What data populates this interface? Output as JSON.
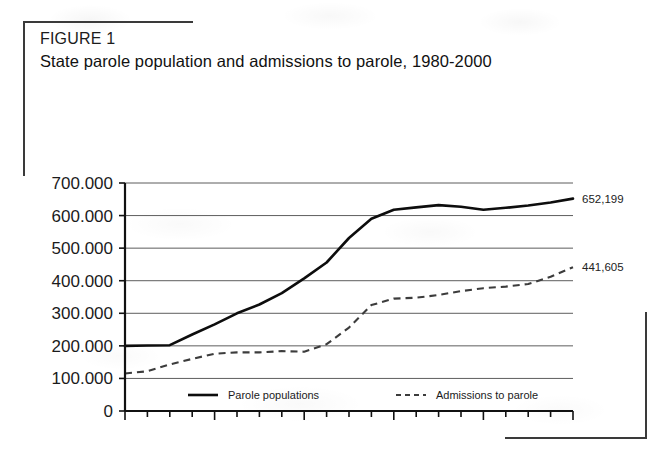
{
  "figure": {
    "label": "FIGURE 1",
    "title": "State parole population and admissions to parole, 1980-2000"
  },
  "chart_data": {
    "type": "line",
    "title": "State parole population and admissions to parole, 1980-2000",
    "xlabel": "",
    "ylabel": "",
    "xlim": [
      1980,
      2000
    ],
    "ylim": [
      0,
      700000
    ],
    "grid": true,
    "legend_position": "bottom",
    "x": [
      1980,
      1981,
      1982,
      1983,
      1984,
      1985,
      1986,
      1987,
      1988,
      1989,
      1990,
      1991,
      1992,
      1993,
      1994,
      1995,
      1996,
      1997,
      1998,
      1999,
      2000
    ],
    "y_ticks": [
      0,
      100000,
      200000,
      300000,
      400000,
      500000,
      600000,
      700000
    ],
    "y_tick_labels": [
      "0",
      "100.000",
      "200.000",
      "300.000",
      "400.000",
      "500.000",
      "600.000",
      "700.000"
    ],
    "x_ticks": [
      1980,
      1984,
      1988,
      1992,
      1996,
      2000
    ],
    "x_tick_labels": [
      "1980",
      "1984",
      "1988",
      "1992",
      "1996",
      "2000"
    ],
    "series": [
      {
        "name": "Parole populations",
        "style": "solid",
        "color": "#0d0d0d",
        "end_label": "652,199",
        "values": [
          200000,
          201000,
          202000,
          235000,
          266000,
          300000,
          327000,
          362000,
          407000,
          456000,
          531000,
          590000,
          618000,
          625000,
          632000,
          627000,
          618000,
          624000,
          631000,
          640000,
          652199
        ]
      },
      {
        "name": "Admissions to parole",
        "style": "dashed",
        "color": "#3c3c3c",
        "end_label": "441,605",
        "values": [
          115000,
          122000,
          143000,
          160000,
          176000,
          180000,
          180000,
          184000,
          182000,
          205000,
          256000,
          325000,
          345000,
          348000,
          356000,
          368000,
          377000,
          382000,
          390000,
          412000,
          441605
        ]
      }
    ]
  },
  "legend": {
    "items": [
      {
        "label": "Parole populations",
        "style": "solid"
      },
      {
        "label": "Admissions to parole",
        "style": "dashed"
      }
    ]
  }
}
